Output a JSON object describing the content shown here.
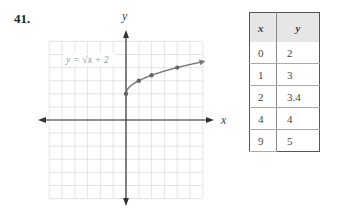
{
  "problem": {
    "number": "41."
  },
  "graph": {
    "x_axis_label": "x",
    "y_axis_label": "y",
    "equation_label": "y = √x + 2",
    "curve_color": "#777777",
    "grid_color": "#dddddd",
    "axis_color": "#333333"
  },
  "table": {
    "headers": [
      "x",
      "y"
    ],
    "rows": [
      {
        "x": "0",
        "y": "2"
      },
      {
        "x": "1",
        "y": "3"
      },
      {
        "x": "2",
        "y": "3.4"
      },
      {
        "x": "4",
        "y": "4"
      },
      {
        "x": "9",
        "y": "5"
      }
    ]
  },
  "chart_data": {
    "type": "line",
    "title": "y = √x + 2",
    "xlabel": "x",
    "ylabel": "y",
    "xlim": [
      -6,
      6
    ],
    "ylim": [
      -6,
      6
    ],
    "grid": true,
    "series": [
      {
        "name": "y = √x + 2",
        "x": [
          0,
          1,
          2,
          4,
          6
        ],
        "y": [
          2,
          3,
          3.41,
          4,
          4.45
        ],
        "marked_points": [
          [
            0,
            2
          ],
          [
            1,
            3
          ],
          [
            2,
            3.4
          ],
          [
            4,
            4
          ]
        ]
      }
    ],
    "table": {
      "x": [
        0,
        1,
        2,
        4,
        9
      ],
      "y": [
        2,
        3,
        3.4,
        4,
        5
      ]
    }
  }
}
